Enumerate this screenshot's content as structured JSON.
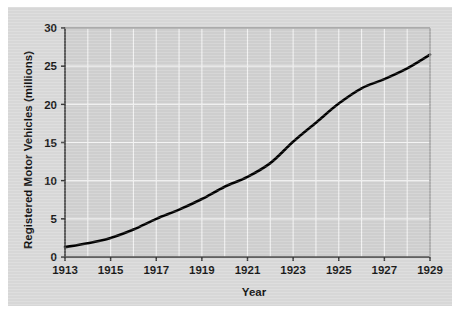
{
  "figure": {
    "background_color": "#d9d9d9",
    "page_background_color": "#ffffff",
    "plot_area_color": "#d0d0d0",
    "gridline_color": "#f2f2f2",
    "axis_color": "#3a3a3a",
    "series_color": "#000000"
  },
  "chart_data": {
    "type": "line",
    "title": "",
    "xlabel": "Year",
    "ylabel": "Registered Motor Vehicles (millions)",
    "xlim": [
      1913,
      1929
    ],
    "ylim": [
      0,
      30
    ],
    "grid": true,
    "legend": "none",
    "xticks": [
      1913,
      1915,
      1917,
      1919,
      1921,
      1923,
      1925,
      1927,
      1929
    ],
    "xtick_labels": [
      "1913",
      "1915",
      "1917",
      "1919",
      "1921",
      "1923",
      "1925",
      "1927",
      "1929"
    ],
    "yticks": [
      0,
      5,
      10,
      15,
      20,
      25,
      30
    ],
    "ytick_labels": [
      "0",
      "5",
      "10",
      "15",
      "20",
      "25",
      "30"
    ],
    "x": [
      1913,
      1914,
      1915,
      1916,
      1917,
      1918,
      1919,
      1920,
      1921,
      1922,
      1923,
      1924,
      1925,
      1926,
      1927,
      1928,
      1929
    ],
    "values": [
      1.3,
      1.8,
      2.5,
      3.6,
      5.0,
      6.2,
      7.6,
      9.2,
      10.5,
      12.3,
      15.1,
      17.6,
      20.1,
      22.1,
      23.3,
      24.7,
      26.5
    ],
    "series": [
      {
        "name": "Registered Motor Vehicles",
        "values": [
          1.3,
          1.8,
          2.5,
          3.6,
          5.0,
          6.2,
          7.6,
          9.2,
          10.5,
          12.3,
          15.1,
          17.6,
          20.1,
          22.1,
          23.3,
          24.7,
          26.5
        ]
      }
    ]
  }
}
